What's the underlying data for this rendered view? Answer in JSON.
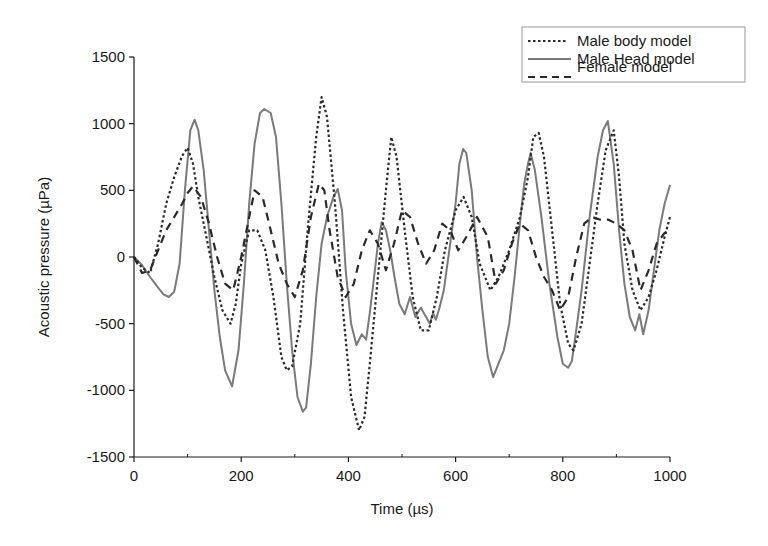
{
  "chart_data": {
    "type": "line",
    "title": "",
    "xlabel": "Time (µs)",
    "ylabel": "Acoustic pressure (µPa)",
    "xlim": [
      0,
      1000
    ],
    "ylim": [
      -1500,
      1500
    ],
    "xticks": [
      0,
      200,
      400,
      600,
      800,
      1000
    ],
    "yticks": [
      -1500,
      -1000,
      -500,
      0,
      500,
      1000,
      1500
    ],
    "xtick_labels": [
      "0",
      "200",
      "400",
      "600",
      "800",
      "1000"
    ],
    "ytick_labels": [
      "-1500",
      "-1000",
      "-500",
      "0",
      "500",
      "1000",
      "1500"
    ],
    "grid": false,
    "legend_position": "top-right",
    "series": [
      {
        "name": "Male body model",
        "style": "dotted",
        "color": "#2a2a2a",
        "x": [
          0,
          15,
          30,
          45,
          60,
          75,
          90,
          100,
          110,
          120,
          135,
          150,
          165,
          180,
          190,
          200,
          215,
          230,
          245,
          260,
          275,
          285,
          295,
          310,
          325,
          340,
          350,
          360,
          375,
          390,
          405,
          420,
          430,
          440,
          455,
          470,
          480,
          490,
          505,
          520,
          535,
          550,
          565,
          580,
          600,
          615,
          630,
          645,
          665,
          680,
          700,
          720,
          735,
          745,
          755,
          765,
          780,
          795,
          810,
          820,
          835,
          850,
          865,
          880,
          895,
          905,
          915,
          930,
          945,
          960,
          975,
          990,
          1000
        ],
        "y": [
          0,
          -80,
          -120,
          100,
          400,
          600,
          760,
          820,
          700,
          450,
          150,
          -150,
          -400,
          -500,
          -350,
          -50,
          200,
          200,
          50,
          -300,
          -750,
          -850,
          -820,
          -500,
          250,
          900,
          1200,
          1050,
          400,
          -400,
          -1050,
          -1300,
          -1200,
          -800,
          -150,
          500,
          900,
          750,
          200,
          -300,
          -550,
          -550,
          -300,
          50,
          350,
          450,
          300,
          -50,
          -250,
          -150,
          50,
          300,
          600,
          900,
          930,
          750,
          200,
          -350,
          -650,
          -700,
          -500,
          -50,
          400,
          800,
          950,
          600,
          100,
          -250,
          -400,
          -300,
          -100,
          150,
          300
        ]
      },
      {
        "name": "Male Head model",
        "style": "solid",
        "color": "#7a7a7a",
        "x": [
          0,
          15,
          30,
          45,
          55,
          65,
          75,
          85,
          95,
          105,
          113,
          120,
          130,
          140,
          150,
          160,
          170,
          183,
          195,
          205,
          215,
          225,
          235,
          243,
          255,
          265,
          275,
          285,
          295,
          305,
          315,
          321,
          330,
          340,
          350,
          360,
          372,
          380,
          388,
          395,
          405,
          415,
          425,
          433,
          440,
          448,
          455,
          462,
          470,
          478,
          486,
          495,
          505,
          515,
          525,
          535,
          545,
          552,
          558,
          563,
          570,
          578,
          590,
          600,
          607,
          614,
          620,
          630,
          640,
          650,
          660,
          670,
          680,
          690,
          700,
          710,
          720,
          728,
          735,
          740,
          748,
          760,
          775,
          790,
          800,
          810,
          817,
          825,
          835,
          850,
          865,
          875,
          884,
          895,
          905,
          915,
          925,
          935,
          943,
          950,
          960,
          970,
          980,
          990,
          1000
        ],
        "y": [
          0,
          -60,
          -150,
          -230,
          -280,
          -300,
          -260,
          -50,
          500,
          950,
          1030,
          950,
          650,
          200,
          -250,
          -600,
          -850,
          -970,
          -700,
          -200,
          400,
          850,
          1080,
          1110,
          1080,
          900,
          400,
          -200,
          -700,
          -1050,
          -1160,
          -1130,
          -800,
          -300,
          100,
          300,
          450,
          510,
          350,
          -100,
          -500,
          -660,
          -580,
          -620,
          -420,
          -150,
          100,
          260,
          200,
          50,
          -150,
          -350,
          -430,
          -300,
          -450,
          -380,
          -450,
          -500,
          -420,
          -470,
          -380,
          -250,
          100,
          400,
          700,
          810,
          780,
          500,
          0,
          -400,
          -750,
          -900,
          -800,
          -700,
          -500,
          -150,
          250,
          550,
          700,
          780,
          650,
          300,
          -200,
          -600,
          -800,
          -830,
          -780,
          -550,
          -250,
          300,
          750,
          950,
          1020,
          700,
          200,
          -200,
          -450,
          -550,
          -430,
          -580,
          -400,
          -100,
          200,
          400,
          540
        ]
      },
      {
        "name": "Female model",
        "style": "dashed",
        "color": "#2a2a2a",
        "x": [
          0,
          15,
          30,
          45,
          60,
          75,
          90,
          100,
          110,
          125,
          140,
          155,
          170,
          185,
          200,
          215,
          225,
          240,
          255,
          270,
          285,
          300,
          315,
          330,
          345,
          355,
          365,
          380,
          395,
          410,
          425,
          440,
          455,
          470,
          485,
          500,
          515,
          530,
          545,
          560,
          575,
          590,
          605,
          620,
          640,
          660,
          675,
          690,
          705,
          720,
          735,
          750,
          765,
          780,
          795,
          810,
          825,
          840,
          855,
          870,
          885,
          900,
          915,
          930,
          945,
          960,
          975,
          990,
          1000
        ],
        "y": [
          0,
          -120,
          -100,
          50,
          200,
          300,
          400,
          480,
          530,
          450,
          250,
          0,
          -200,
          -250,
          0,
          300,
          500,
          450,
          200,
          -50,
          -200,
          -300,
          -100,
          300,
          550,
          500,
          200,
          -150,
          -300,
          -200,
          50,
          200,
          100,
          -100,
          100,
          350,
          300,
          100,
          -50,
          50,
          250,
          200,
          50,
          150,
          300,
          150,
          -200,
          -100,
          100,
          250,
          200,
          0,
          -150,
          -250,
          -400,
          -300,
          0,
          250,
          300,
          280,
          280,
          250,
          200,
          50,
          -250,
          -100,
          100,
          180,
          200
        ]
      }
    ]
  }
}
